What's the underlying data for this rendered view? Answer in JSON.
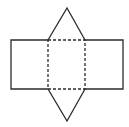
{
  "diagram": {
    "type": "net",
    "colors": {
      "stroke": "#2b2b2b",
      "background": "#ffffff"
    },
    "shapes": {
      "left_rect": {
        "x": 11,
        "y": 40,
        "w": 37,
        "h": 49
      },
      "center_square": {
        "x": 48,
        "y": 40,
        "w": 37,
        "h": 49
      },
      "right_rect": {
        "x": 85,
        "y": 40,
        "w": 38,
        "h": 49
      },
      "top_triangle": {
        "points": "48,40 67,8 85,40"
      },
      "bottom_triangle": {
        "points": "48,89 67,121 85,89"
      }
    },
    "fold_lines": "dashed"
  }
}
